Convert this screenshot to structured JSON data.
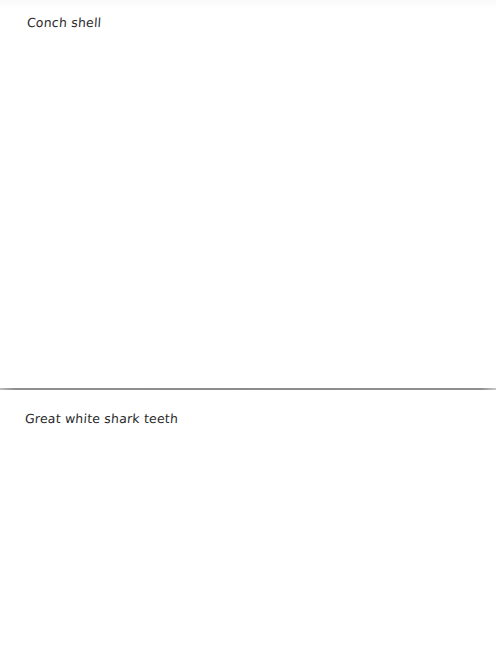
{
  "document": {
    "sections": [
      {
        "label": "Conch shell"
      },
      {
        "label": "Great white shark teeth"
      }
    ]
  },
  "colors": {
    "background": "#ffffff",
    "text": "#2a2a2a",
    "divider": "#8c8c8c"
  }
}
